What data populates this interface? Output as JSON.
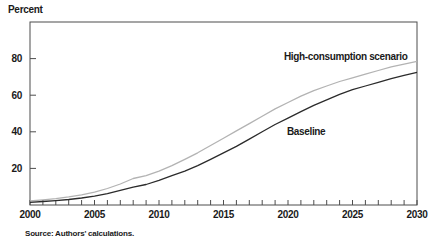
{
  "source": "Source: Authors' calculations.",
  "chart_data": {
    "type": "line",
    "title": "",
    "xlabel": "",
    "ylabel": "Percent",
    "xlim": [
      2000,
      2030
    ],
    "ylim": [
      0,
      100
    ],
    "yticks": [
      20,
      40,
      60,
      80
    ],
    "xticks_labeled": [
      2000,
      2005,
      2010,
      2015,
      2020,
      2025,
      2030
    ],
    "xticks_minor_every": 1,
    "grid": false,
    "legend": "inline-annotations",
    "axis_color": "#4d4d4d",
    "x": [
      2000,
      2001,
      2002,
      2003,
      2004,
      2005,
      2006,
      2007,
      2008,
      2009,
      2010,
      2011,
      2012,
      2013,
      2014,
      2015,
      2016,
      2017,
      2018,
      2019,
      2020,
      2021,
      2022,
      2023,
      2024,
      2025,
      2026,
      2027,
      2028,
      2029,
      2030
    ],
    "series": [
      {
        "name": "High-consumption scenario",
        "color": "#b3b3b3",
        "values": [
          2.2,
          2.8,
          3.5,
          4.4,
          5.5,
          7.0,
          9.0,
          11.5,
          14.5,
          16.0,
          18.5,
          21.5,
          25.0,
          28.5,
          32.5,
          36.5,
          40.5,
          44.5,
          48.5,
          52.5,
          56.0,
          59.5,
          62.5,
          65.0,
          67.5,
          69.5,
          71.5,
          73.5,
          75.5,
          77.0,
          78.5
        ]
      },
      {
        "name": "Baseline",
        "color": "#2b2b2b",
        "values": [
          1.5,
          1.9,
          2.4,
          3.0,
          3.8,
          4.8,
          6.2,
          8.0,
          9.8,
          11.2,
          13.5,
          16.0,
          18.5,
          21.5,
          25.0,
          28.5,
          32.0,
          36.0,
          40.0,
          44.0,
          47.5,
          51.0,
          54.5,
          57.5,
          60.5,
          63.0,
          65.0,
          67.0,
          69.0,
          70.8,
          72.5
        ]
      }
    ]
  }
}
